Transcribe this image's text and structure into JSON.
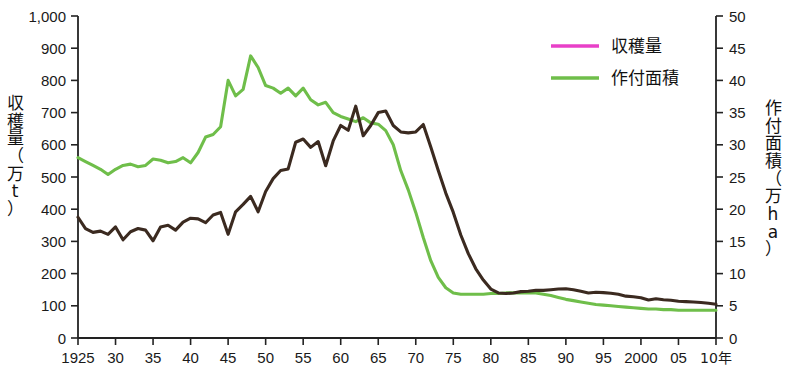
{
  "chart_data": {
    "type": "line",
    "title": "",
    "xlabel": "年",
    "x_unit_label": "年",
    "grid": false,
    "legend_position": "top-right",
    "x": [
      1925,
      1926,
      1927,
      1928,
      1929,
      1930,
      1931,
      1932,
      1933,
      1934,
      1935,
      1936,
      1937,
      1938,
      1939,
      1940,
      1941,
      1942,
      1943,
      1944,
      1945,
      1946,
      1947,
      1948,
      1949,
      1950,
      1951,
      1952,
      1953,
      1954,
      1955,
      1956,
      1957,
      1958,
      1959,
      1960,
      1961,
      1962,
      1963,
      1964,
      1965,
      1966,
      1967,
      1968,
      1969,
      1970,
      1971,
      1972,
      1973,
      1974,
      1975,
      1976,
      1977,
      1978,
      1979,
      1980,
      1981,
      1982,
      1983,
      1984,
      1985,
      1986,
      1987,
      1988,
      1989,
      1990,
      1991,
      1992,
      1993,
      1994,
      1995,
      1996,
      1997,
      1998,
      1999,
      2000,
      2001,
      2002,
      2003,
      2004,
      2005,
      2006,
      2007,
      2008,
      2009,
      2010
    ],
    "x_tick_labels": [
      "1925",
      "30",
      "35",
      "40",
      "45",
      "50",
      "55",
      "60",
      "65",
      "70",
      "75",
      "80",
      "85",
      "90",
      "95",
      "2000",
      "05",
      "10年"
    ],
    "x_tick_values": [
      1925,
      1930,
      1935,
      1940,
      1945,
      1950,
      1955,
      1960,
      1965,
      1970,
      1975,
      1980,
      1985,
      1990,
      1995,
      2000,
      2005,
      2010
    ],
    "xlim": [
      1925,
      2010
    ],
    "axes": [
      {
        "id": "left",
        "label": "収穫量（万t）",
        "label_chars": "収穫量（万t）",
        "unit": "万t",
        "ylim": [
          0,
          1000
        ],
        "ticks": [
          0,
          100,
          200,
          300,
          400,
          500,
          600,
          700,
          800,
          900,
          1000
        ],
        "tick_labels": [
          "0",
          "100",
          "200",
          "300",
          "400",
          "500",
          "600",
          "700",
          "800",
          "900",
          "1,000"
        ]
      },
      {
        "id": "right",
        "label": "作付面積（万ha）",
        "label_chars": "作付面積（万ha）",
        "unit": "万ha",
        "ylim": [
          0,
          50
        ],
        "ticks": [
          0,
          5,
          10,
          15,
          20,
          25,
          30,
          35,
          40,
          45,
          50
        ],
        "tick_labels": [
          "0",
          "5",
          "10",
          "15",
          "20",
          "25",
          "30",
          "35",
          "40",
          "45",
          "50"
        ]
      }
    ],
    "series": [
      {
        "name": "収穫量",
        "legend_label": "収穫量",
        "legend_swatch_color": "#E840C8",
        "line_color": "#3B2A20",
        "axis": "left",
        "unit": "万t",
        "values": [
          375,
          340,
          328,
          332,
          322,
          345,
          305,
          330,
          340,
          335,
          302,
          345,
          350,
          335,
          360,
          372,
          370,
          358,
          382,
          390,
          322,
          392,
          415,
          440,
          392,
          455,
          495,
          520,
          525,
          608,
          618,
          592,
          610,
          535,
          612,
          660,
          645,
          720,
          628,
          660,
          700,
          705,
          660,
          640,
          637,
          640,
          663,
          593,
          520,
          450,
          390,
          320,
          262,
          215,
          180,
          152,
          140,
          138,
          140,
          144,
          145,
          148,
          148,
          150,
          152,
          153,
          150,
          145,
          140,
          142,
          141,
          139,
          136,
          130,
          128,
          125,
          118,
          122,
          119,
          117,
          114,
          113,
          112,
          110,
          108,
          105
        ],
        "key_points": [
          {
            "x": 1925,
            "y": 375
          },
          {
            "x": 1934,
            "y": 302
          },
          {
            "x": 1955,
            "y": 720
          },
          {
            "x": 1963,
            "y": 660
          },
          {
            "x": 1970,
            "y": 640
          },
          {
            "x": 1975,
            "y": 390
          },
          {
            "x": 1980,
            "y": 152
          },
          {
            "x": 2010,
            "y": 105
          }
        ]
      },
      {
        "name": "作付面積",
        "legend_label": "作付面積",
        "legend_swatch_color": "#6FBE4A",
        "line_color": "#6FBE4A",
        "axis": "right",
        "unit": "万ha",
        "values_man_ha": [
          28.0,
          27.4,
          26.8,
          26.2,
          25.4,
          26.2,
          26.8,
          27.0,
          26.6,
          26.8,
          27.8,
          27.6,
          27.2,
          27.4,
          28.0,
          27.2,
          28.8,
          31.2,
          31.6,
          32.8,
          40.0,
          37.6,
          38.6,
          43.8,
          42.0,
          39.2,
          38.8,
          38.0,
          38.8,
          37.6,
          38.8,
          37.0,
          36.2,
          36.6,
          35.0,
          34.4,
          34.0,
          33.6,
          34.2,
          33.4,
          33.2,
          32.2,
          30.0,
          26.0,
          23.0,
          19.5,
          15.6,
          12.0,
          9.4,
          7.8,
          7.0,
          6.8,
          6.8,
          6.8,
          6.8,
          6.9,
          6.9,
          7.0,
          7.0,
          7.0,
          7.0,
          7.0,
          6.8,
          6.6,
          6.3,
          6.0,
          5.8,
          5.6,
          5.4,
          5.2,
          5.1,
          5.0,
          4.9,
          4.8,
          4.7,
          4.6,
          4.5,
          4.5,
          4.4,
          4.4,
          4.3,
          4.3,
          4.3,
          4.3,
          4.3,
          4.3
        ],
        "values_display_left_scale": [
          560,
          548,
          536,
          524,
          508,
          524,
          536,
          540,
          532,
          536,
          556,
          552,
          544,
          548,
          560,
          544,
          576,
          624,
          632,
          656,
          800,
          752,
          772,
          876,
          840,
          784,
          776,
          760,
          776,
          752,
          776,
          740,
          724,
          732,
          700,
          688,
          680,
          672,
          684,
          668,
          664,
          644,
          600,
          520,
          460,
          390,
          312,
          240,
          188,
          156,
          140,
          136,
          136,
          136,
          136,
          138,
          138,
          140,
          140,
          140,
          140,
          140,
          136,
          132,
          126,
          120,
          116,
          112,
          108,
          104,
          102,
          100,
          98,
          96,
          94,
          92,
          90,
          90,
          88,
          88,
          86,
          86,
          86,
          86,
          86,
          86
        ],
        "key_points": [
          {
            "x": 1925,
            "y_man_ha": 28.0
          },
          {
            "x": 1929,
            "y_man_ha": 25.4
          },
          {
            "x": 1945,
            "y_man_ha": 40.0
          },
          {
            "x": 1949,
            "y_man_ha": 43.8
          },
          {
            "x": 1955,
            "y_man_ha": 38.8
          },
          {
            "x": 1965,
            "y_man_ha": 33.2
          },
          {
            "x": 1975,
            "y_man_ha": 7.0
          },
          {
            "x": 2010,
            "y_man_ha": 4.3
          }
        ]
      }
    ]
  }
}
